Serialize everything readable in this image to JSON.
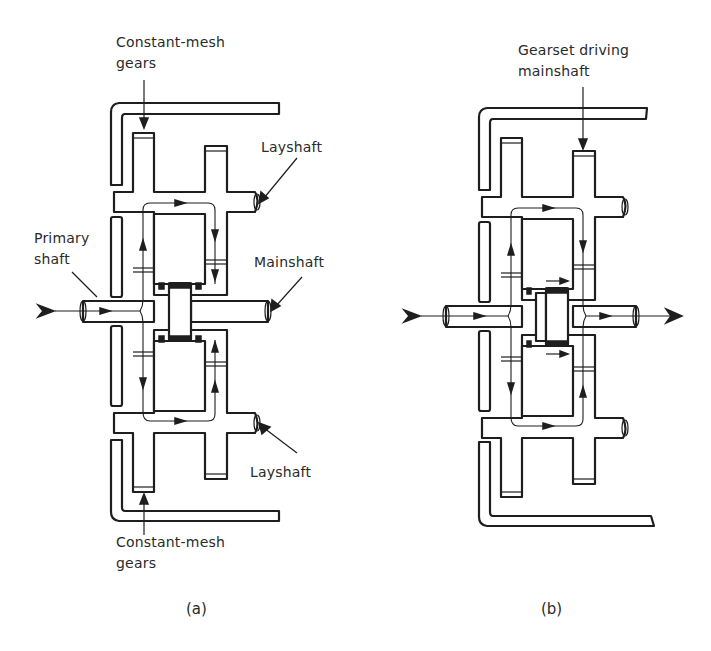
{
  "figure": {
    "panels": [
      {
        "id": "a",
        "caption": "(a)",
        "labels": {
          "constant_mesh_top_line1": "Constant-mesh",
          "constant_mesh_top_line2": "gears",
          "layshaft_top": "Layshaft",
          "primary_shaft_line1": "Primary",
          "primary_shaft_line2": "shaft",
          "mainshaft": "Mainshaft",
          "layshaft_bottom": "Layshaft",
          "constant_mesh_bottom_line1": "Constant-mesh",
          "constant_mesh_bottom_line2": "gears"
        },
        "state": "neutral - power flows through layshafts, mainshaft not driven"
      },
      {
        "id": "b",
        "caption": "(b)",
        "labels": {
          "gearset_line1": "Gearset driving",
          "gearset_line2": "mainshaft"
        },
        "state": "gear engaged - dog clutch shifted right, mainshaft driven"
      }
    ],
    "colors": {
      "ink": "#1e1e1e",
      "background": "#ffffff",
      "text": "#2a2a2a"
    }
  }
}
